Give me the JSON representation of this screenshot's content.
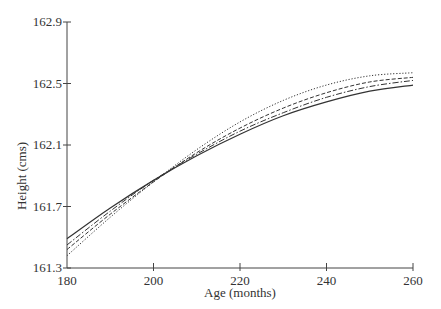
{
  "chart_data": {
    "type": "line",
    "title": "",
    "xlabel": "Age (months)",
    "ylabel": "Height (cms)",
    "xlim": [
      180,
      260
    ],
    "ylim": [
      161.3,
      162.9
    ],
    "xticks": [
      180,
      200,
      220,
      240,
      260
    ],
    "yticks": [
      161.3,
      161.7,
      162.1,
      162.5,
      162.9
    ],
    "xtick_labels": [
      "180",
      "200",
      "220",
      "240",
      "260"
    ],
    "ytick_labels": [
      "161.3",
      "161.7",
      "162.1",
      "162.5",
      "162.9"
    ],
    "grid": false,
    "legend": null,
    "x": [
      180,
      190,
      200,
      210,
      220,
      230,
      240,
      250,
      260
    ],
    "series": [
      {
        "name": "solid",
        "style": "solid",
        "values": [
          161.49,
          161.69,
          161.87,
          162.03,
          162.17,
          162.29,
          162.38,
          162.45,
          162.49
        ]
      },
      {
        "name": "dash-dot",
        "style": "dashdot",
        "values": [
          161.45,
          161.67,
          161.87,
          162.04,
          162.19,
          162.31,
          162.41,
          162.48,
          162.52
        ]
      },
      {
        "name": "dashed",
        "style": "dashed",
        "values": [
          161.42,
          161.65,
          161.86,
          162.05,
          162.21,
          162.34,
          162.44,
          162.51,
          162.54
        ]
      },
      {
        "name": "dotted",
        "style": "dotted",
        "values": [
          161.38,
          161.63,
          161.86,
          162.07,
          162.25,
          162.39,
          162.49,
          162.55,
          162.57
        ]
      }
    ]
  }
}
